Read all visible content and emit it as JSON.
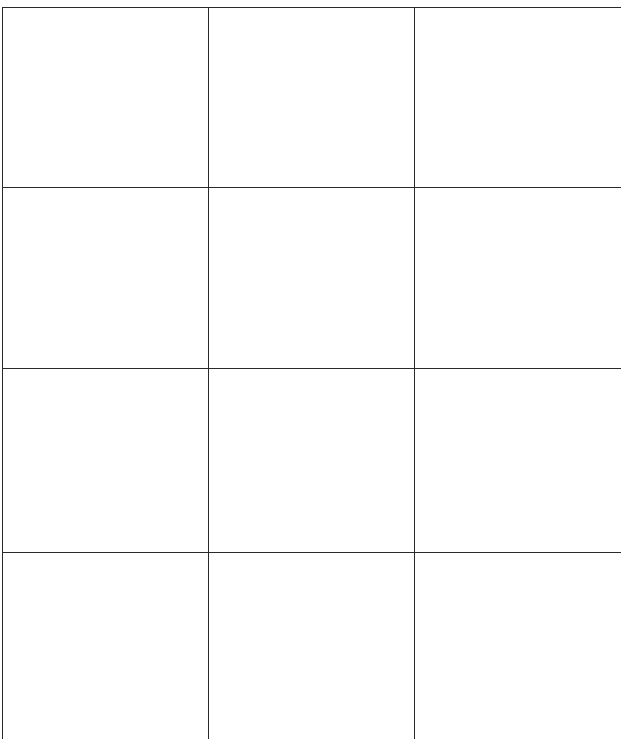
{
  "grid": {
    "rows": 4,
    "columns": 3,
    "line_color": "#2a2a2a",
    "background": "#ffffff",
    "cells": [
      [
        "",
        "",
        ""
      ],
      [
        "",
        "",
        ""
      ],
      [
        "",
        "",
        ""
      ],
      [
        "",
        "",
        ""
      ]
    ]
  }
}
